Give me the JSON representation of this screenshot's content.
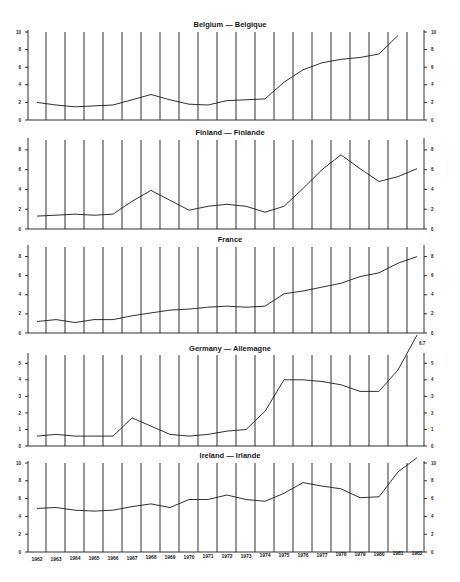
{
  "chart_data": [
    {
      "type": "line",
      "title": "Belgium — Belgique",
      "x": [
        1962,
        1963,
        1964,
        1965,
        1966,
        1967,
        1968,
        1969,
        1970,
        1971,
        1972,
        1973,
        1974,
        1975,
        1976,
        1977,
        1978,
        1979,
        1980,
        1981,
        1982
      ],
      "values": [
        2.0,
        1.7,
        1.5,
        1.6,
        1.7,
        2.3,
        2.9,
        2.3,
        1.8,
        1.7,
        2.2,
        2.3,
        2.4,
        4.3,
        5.7,
        6.5,
        6.9,
        7.1,
        7.5,
        9.6,
        null
      ],
      "ylim": [
        0,
        10
      ],
      "yticks": [
        0,
        2,
        4,
        6,
        8,
        10
      ],
      "xlabel": "",
      "ylabel": "",
      "grid": "vertical"
    },
    {
      "type": "line",
      "title": "Finland — Finlande",
      "x": [
        1962,
        1963,
        1964,
        1965,
        1966,
        1967,
        1968,
        1969,
        1970,
        1971,
        1972,
        1973,
        1974,
        1975,
        1976,
        1977,
        1978,
        1979,
        1980,
        1981,
        1982
      ],
      "values": [
        1.3,
        1.4,
        1.5,
        1.4,
        1.5,
        2.8,
        3.9,
        2.9,
        1.9,
        2.3,
        2.5,
        2.3,
        1.7,
        2.3,
        4.1,
        6.0,
        7.5,
        6.1,
        4.8,
        5.3,
        6.1
      ],
      "ylim": [
        0,
        9
      ],
      "yticks": [
        0,
        2,
        4,
        6,
        8
      ],
      "xlabel": "",
      "ylabel": "",
      "grid": "vertical"
    },
    {
      "type": "line",
      "title": "France",
      "x": [
        1962,
        1963,
        1964,
        1965,
        1966,
        1967,
        1968,
        1969,
        1970,
        1971,
        1972,
        1973,
        1974,
        1975,
        1976,
        1977,
        1978,
        1979,
        1980,
        1981,
        1982
      ],
      "values": [
        1.2,
        1.4,
        1.1,
        1.4,
        1.4,
        1.8,
        2.1,
        2.4,
        2.5,
        2.7,
        2.8,
        2.7,
        2.8,
        4.1,
        4.4,
        4.8,
        5.2,
        5.9,
        6.3,
        7.3,
        8.0
      ],
      "ylim": [
        0,
        9
      ],
      "yticks": [
        0,
        2,
        4,
        6,
        8
      ],
      "xlabel": "",
      "ylabel": "",
      "grid": "vertical"
    },
    {
      "type": "line",
      "title": "Germany — Allemagne",
      "x": [
        1962,
        1963,
        1964,
        1965,
        1966,
        1967,
        1968,
        1969,
        1970,
        1971,
        1972,
        1973,
        1974,
        1975,
        1976,
        1977,
        1978,
        1979,
        1980,
        1981,
        1982
      ],
      "values": [
        0.6,
        0.7,
        0.6,
        0.6,
        0.6,
        1.7,
        1.2,
        0.7,
        0.6,
        0.7,
        0.9,
        1.0,
        2.1,
        4.0,
        4.0,
        3.9,
        3.7,
        3.3,
        3.3,
        4.6,
        6.7
      ],
      "ylim": [
        0,
        5.5
      ],
      "yticks": [
        0,
        1,
        2,
        3,
        4,
        5
      ],
      "annotations": [
        {
          "x": 1982,
          "text": "6.7"
        }
      ],
      "xlabel": "",
      "ylabel": "",
      "grid": "vertical"
    },
    {
      "type": "line",
      "title": "Ireland — Irlande",
      "x": [
        1962,
        1963,
        1964,
        1965,
        1966,
        1967,
        1968,
        1969,
        1970,
        1971,
        1972,
        1973,
        1974,
        1975,
        1976,
        1977,
        1978,
        1979,
        1980,
        1981,
        1982
      ],
      "values": [
        4.9,
        5.0,
        4.7,
        4.6,
        4.7,
        5.1,
        5.4,
        5.0,
        5.9,
        5.9,
        6.4,
        5.9,
        5.7,
        6.6,
        7.8,
        7.4,
        7.1,
        6.1,
        6.2,
        9.0,
        10.6
      ],
      "ylim": [
        0,
        10
      ],
      "yticks": [
        0,
        2,
        4,
        6,
        8,
        10
      ],
      "xlabel": "",
      "ylabel": "",
      "grid": "vertical"
    }
  ],
  "x_axis": {
    "labels": [
      "1962",
      "1963",
      "1964",
      "1965",
      "1966",
      "1967",
      "1968",
      "1969",
      "1970",
      "1971",
      "1972",
      "1973",
      "1974",
      "1975",
      "1976",
      "1977",
      "1978",
      "1979",
      "1980",
      "1981",
      "1982"
    ]
  }
}
